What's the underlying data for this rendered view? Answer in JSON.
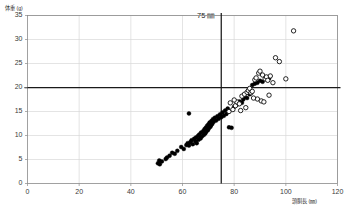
{
  "chart_data": {
    "type": "scatter",
    "title": "",
    "xlabel": "頭胴長 (㎜)",
    "ylabel": "体重 (g)",
    "xlim": [
      0,
      120
    ],
    "ylim": [
      0,
      35
    ],
    "xticks": [
      0,
      20,
      40,
      60,
      80,
      100,
      120
    ],
    "yticks": [
      0,
      5,
      10,
      15,
      20,
      25,
      30,
      35
    ],
    "grid": true,
    "legend_position": "none",
    "annotations": [
      {
        "text": "75 ㎜",
        "x": 75,
        "y": 35,
        "kind": "vline-label"
      }
    ],
    "reference_lines": [
      {
        "orientation": "vertical",
        "value": 75,
        "label": "75 ㎜",
        "color": "#1a1a1a"
      },
      {
        "orientation": "horizontal",
        "value": 20,
        "label": "",
        "color": "#1a1a1a"
      }
    ],
    "series": [
      {
        "name": "filled",
        "marker": "filled-circle",
        "color": "#000000",
        "points": [
          [
            50.5,
            4.2
          ],
          [
            51.2,
            4.0
          ],
          [
            51.0,
            4.8
          ],
          [
            52.0,
            4.6
          ],
          [
            53.5,
            5.1
          ],
          [
            56.0,
            6.4
          ],
          [
            58.0,
            6.8
          ],
          [
            59.5,
            7.6
          ],
          [
            60.5,
            7.2
          ],
          [
            61.5,
            8.0
          ],
          [
            62.0,
            8.4
          ],
          [
            62.5,
            7.9
          ],
          [
            63.0,
            8.6
          ],
          [
            63.5,
            9.0
          ],
          [
            64.0,
            8.2
          ],
          [
            64.5,
            9.3
          ],
          [
            65.0,
            8.8
          ],
          [
            65.2,
            9.6
          ],
          [
            65.5,
            8.4
          ],
          [
            66.0,
            9.9
          ],
          [
            66.2,
            9.1
          ],
          [
            66.5,
            10.2
          ],
          [
            67.0,
            9.4
          ],
          [
            67.2,
            10.6
          ],
          [
            67.5,
            9.8
          ],
          [
            68.0,
            10.9
          ],
          [
            68.2,
            10.1
          ],
          [
            68.5,
            11.3
          ],
          [
            68.8,
            10.4
          ],
          [
            69.0,
            11.6
          ],
          [
            69.2,
            10.8
          ],
          [
            69.5,
            12.0
          ],
          [
            69.8,
            11.1
          ],
          [
            70.0,
            12.3
          ],
          [
            70.2,
            11.5
          ],
          [
            70.5,
            12.7
          ],
          [
            70.8,
            11.8
          ],
          [
            71.0,
            12.1
          ],
          [
            71.2,
            13.0
          ],
          [
            71.5,
            12.4
          ],
          [
            71.8,
            13.4
          ],
          [
            72.0,
            12.8
          ],
          [
            72.5,
            13.7
          ],
          [
            73.0,
            13.1
          ],
          [
            73.5,
            14.0
          ],
          [
            62.5,
            14.6
          ],
          [
            74.0,
            13.5
          ],
          [
            74.5,
            14.4
          ],
          [
            75.0,
            13.8
          ],
          [
            75.5,
            14.8
          ],
          [
            76.0,
            14.1
          ],
          [
            76.5,
            15.2
          ],
          [
            77.0,
            14.5
          ],
          [
            77.5,
            15.6
          ],
          [
            78.0,
            11.7
          ],
          [
            79.0,
            11.6
          ],
          [
            80.0,
            16.0
          ],
          [
            81.0,
            16.4
          ],
          [
            82.0,
            17.1
          ],
          [
            83.0,
            16.8
          ],
          [
            83.5,
            17.5
          ],
          [
            84.0,
            18.0
          ],
          [
            85.0,
            17.8
          ],
          [
            86.0,
            18.6
          ],
          [
            87.0,
            20.5
          ],
          [
            88.0,
            20.8
          ],
          [
            89.0,
            21.0
          ],
          [
            90.0,
            21.4
          ],
          [
            91.0,
            21.2
          ],
          [
            93.0,
            22.0
          ],
          [
            93.5,
            21.9
          ],
          [
            55.0,
            5.8
          ],
          [
            57.0,
            6.2
          ],
          [
            54.0,
            5.4
          ]
        ]
      },
      {
        "name": "open",
        "marker": "open-circle",
        "color": "#000000",
        "points": [
          [
            78.0,
            15.0
          ],
          [
            79.5,
            15.4
          ],
          [
            80.5,
            16.2
          ],
          [
            81.0,
            17.0
          ],
          [
            82.0,
            16.6
          ],
          [
            80.0,
            17.4
          ],
          [
            83.0,
            18.2
          ],
          [
            84.0,
            18.6
          ],
          [
            85.0,
            19.0
          ],
          [
            85.5,
            19.4
          ],
          [
            86.0,
            19.8
          ],
          [
            86.5,
            18.9
          ],
          [
            87.0,
            19.2
          ],
          [
            88.0,
            21.6
          ],
          [
            88.5,
            22.0
          ],
          [
            89.5,
            23.0
          ],
          [
            90.0,
            23.4
          ],
          [
            91.0,
            22.6
          ],
          [
            92.0,
            21.8
          ],
          [
            92.5,
            22.2
          ],
          [
            93.0,
            21.5
          ],
          [
            94.0,
            22.4
          ],
          [
            95.0,
            21.0
          ],
          [
            96.0,
            26.2
          ],
          [
            97.5,
            25.4
          ],
          [
            100.0,
            21.8
          ],
          [
            103.0,
            31.8
          ],
          [
            89.0,
            17.6
          ],
          [
            90.5,
            17.2
          ],
          [
            87.5,
            17.8
          ],
          [
            91.5,
            17.0
          ],
          [
            93.5,
            18.4
          ],
          [
            84.5,
            15.8
          ],
          [
            82.5,
            15.2
          ],
          [
            78.5,
            16.8
          ]
        ]
      }
    ]
  },
  "axes": {
    "y_tick_labels": [
      "35",
      "30",
      "25",
      "20",
      "15",
      "10",
      "5",
      "0"
    ],
    "x_tick_labels": [
      "0",
      "20",
      "40",
      "60",
      "80",
      "100",
      "120"
    ],
    "y_axis_title": "体重 (g)",
    "x_axis_title": "頭胴長 (㎜)"
  },
  "annotation": {
    "vline_label": "75 ㎜"
  },
  "colors": {
    "grid": "#d9d9d9",
    "axis": "#8a8a8a",
    "reference": "#1a1a1a",
    "marker": "#000000",
    "background": "#ffffff"
  }
}
